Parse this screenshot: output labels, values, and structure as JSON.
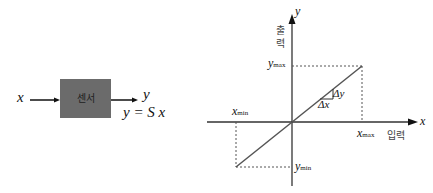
{
  "block_diagram": {
    "input_label": "x",
    "output_label": "y",
    "sensor_label": "센서",
    "equation": "y = S x",
    "box_color": "#6b6b6b"
  },
  "graph": {
    "y_axis_label": "y",
    "y_axis_title": "출력",
    "x_axis_label": "x",
    "x_axis_title": "입력",
    "y_max_label": "y",
    "y_max_sub": "max",
    "y_min_label": "y",
    "y_min_sub": "min",
    "x_max_label": "x",
    "x_max_sub": "max",
    "x_min_label": "x",
    "x_min_sub": "min",
    "delta_y": "Δy",
    "delta_x": "Δx"
  }
}
